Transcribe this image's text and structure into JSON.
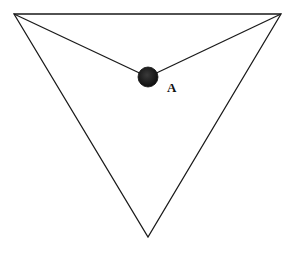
{
  "diagram": {
    "type": "geometry",
    "triangle": {
      "vertices": [
        [
          14,
          14
        ],
        [
          281,
          14
        ],
        [
          148,
          237
        ]
      ],
      "stroke": "#1a1a1a"
    },
    "segments": [
      {
        "from": [
          14,
          14
        ],
        "to": [
          148,
          77
        ]
      },
      {
        "from": [
          281,
          14
        ],
        "to": [
          148,
          77
        ]
      }
    ],
    "point": {
      "label": "A",
      "center": [
        148,
        77
      ],
      "radius": 10,
      "fill": "#1c1c1c"
    },
    "labels": [
      {
        "text": "A",
        "x": 167,
        "y": 92
      }
    ]
  }
}
